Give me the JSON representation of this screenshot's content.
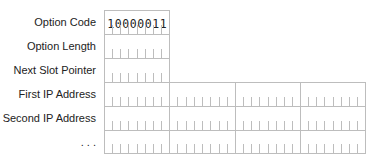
{
  "diagram": {
    "title": "",
    "rows": [
      {
        "label": "Option Code",
        "bytes": 1,
        "bits": [
          "1",
          "0",
          "0",
          "0",
          "0",
          "0",
          "1",
          "1"
        ]
      },
      {
        "label": "Option Length",
        "bytes": 1
      },
      {
        "label": "Next Slot Pointer",
        "bytes": 1
      },
      {
        "label": "First IP Address",
        "bytes": 4
      },
      {
        "label": "Second IP Address",
        "bytes": 4
      },
      {
        "label": ". . .",
        "bytes": 4
      }
    ],
    "colors": {
      "grid": "#bdbdbd",
      "text": "#222222",
      "background": "#ffffff"
    }
  }
}
